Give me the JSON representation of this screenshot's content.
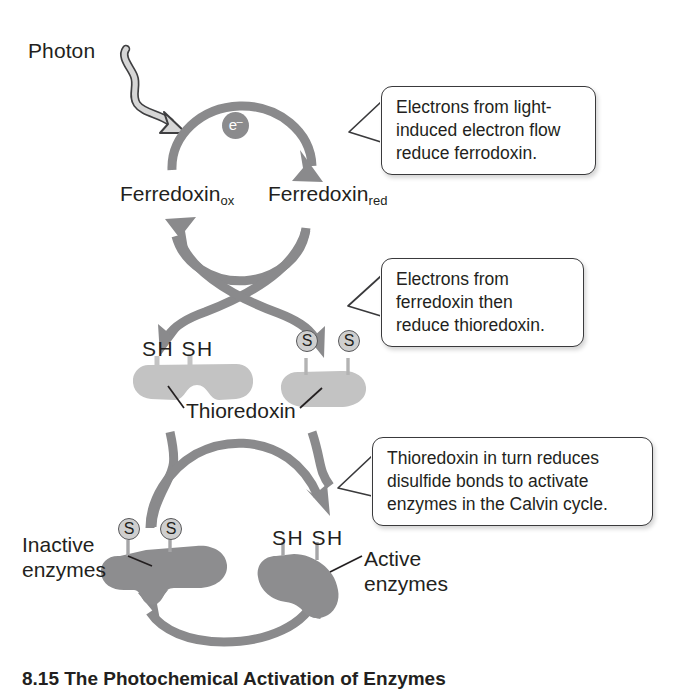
{
  "figure": {
    "caption": "8.15 The Photochemical Activation of Enzymes"
  },
  "colors": {
    "arrow_gray": "#8a8a8c",
    "protein_light": "#c3c3c3",
    "protein_dark": "#8d8d8f",
    "s_circle_fill": "#cfcfcf",
    "outline": "#58585a",
    "text": "#231f20",
    "callout_border": "#3a3a3c",
    "photon_fill": "#d2d2d2"
  },
  "labels": {
    "photon": "Photon",
    "electron": "e",
    "electron_charge": "–",
    "ferredoxin": "Ferredoxin",
    "ferredoxin_ox_sub": "ox",
    "ferredoxin_red_sub": "red",
    "thioredoxin": "Thioredoxin",
    "sh_pair": "SH SH",
    "sulfur": "S",
    "inactive_enzymes": "Inactive enzymes",
    "active_enzymes": "Active enzymes"
  },
  "callouts": [
    {
      "id": "callout-1",
      "lines": [
        "Electrons from light-",
        "induced electron flow",
        "reduce ferrodoxin."
      ]
    },
    {
      "id": "callout-2",
      "lines": [
        "Electrons from",
        "ferredoxin then",
        "reduce thioredoxin."
      ]
    },
    {
      "id": "callout-3",
      "lines": [
        "Thioredoxin in turn reduces",
        "disulfide bonds to activate",
        "enzymes in the Calvin cycle."
      ]
    }
  ],
  "cycles": [
    {
      "name": "ferredoxin-cycle",
      "reactant": "Ferredoxin ox",
      "product": "Ferredoxin red"
    },
    {
      "name": "thioredoxin-cycle",
      "reactant": "Thioredoxin SH SH",
      "product": "Thioredoxin S S"
    },
    {
      "name": "enzyme-cycle",
      "reactant": "Inactive enzymes S S",
      "product": "Active enzymes SH SH"
    }
  ]
}
